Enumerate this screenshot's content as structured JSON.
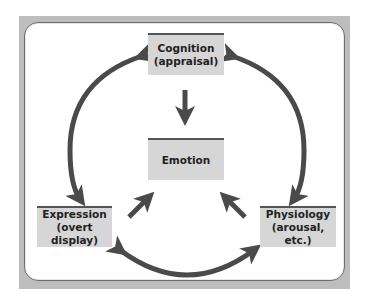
{
  "diagram": {
    "nodes": {
      "cognition": {
        "line1": "Cognition",
        "line2": "(appraisal)"
      },
      "emotion": {
        "line1": "Emotion"
      },
      "expression": {
        "line1": "Expression",
        "line2": "(overt display)"
      },
      "physiology": {
        "line1": "Physiology",
        "line2": "(arousal, etc.)"
      }
    },
    "edges": [
      {
        "from": "cognition",
        "to": "emotion",
        "type": "one-way"
      },
      {
        "from": "expression",
        "to": "emotion",
        "type": "one-way"
      },
      {
        "from": "physiology",
        "to": "emotion",
        "type": "one-way"
      },
      {
        "from": "cognition",
        "to": "expression",
        "type": "two-way"
      },
      {
        "from": "cognition",
        "to": "physiology",
        "type": "two-way"
      },
      {
        "from": "expression",
        "to": "physiology",
        "type": "two-way"
      }
    ],
    "colors": {
      "arrow": "#4a4a4a",
      "node_fill": "#d6d6d6",
      "node_bar": "#555555",
      "frame": "#bdbdbd"
    }
  }
}
